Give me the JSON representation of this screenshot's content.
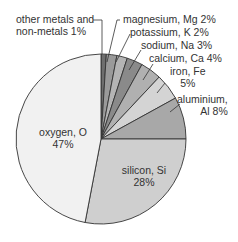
{
  "chart_data": {
    "type": "pie",
    "title": "",
    "start_angle": "12 o'clock",
    "direction": "clockwise",
    "slices": [
      {
        "label": "other metals and non-metals",
        "value": 1,
        "color": "#6e6e6e"
      },
      {
        "label": "magnesium, Mg",
        "value": 2,
        "color": "#9a9a9a"
      },
      {
        "label": "potassium, K",
        "value": 2,
        "color": "#b4b4b4"
      },
      {
        "label": "sodium, Na",
        "value": 3,
        "color": "#8a8a8a"
      },
      {
        "label": "calcium, Ca",
        "value": 4,
        "color": "#b0b0b0"
      },
      {
        "label": "iron, Fe",
        "value": 5,
        "color": "#d4d4d4"
      },
      {
        "label": "aluminium, Al",
        "value": 8,
        "color": "#a8a8a8"
      },
      {
        "label": "silicon, Si",
        "value": 28,
        "color": "#cfcfcf"
      },
      {
        "label": "oxygen, O",
        "value": 47,
        "color": "#f1f1f1"
      }
    ]
  },
  "labels": {
    "other_1": "other metals and",
    "other_2": "non-metals   1%",
    "mg": "magnesium, Mg   2%",
    "k": "potassium, K   2%",
    "na": "sodium, Na   3%",
    "ca": "calcium, Ca   4%",
    "fe_1": "iron, Fe",
    "fe_2": "5%",
    "al_1": "aluminium,",
    "al_2": "Al   8%",
    "o_1": "oxygen, O",
    "o_2": "47%",
    "si_1": "silicon, Si",
    "si_2": "28%"
  }
}
